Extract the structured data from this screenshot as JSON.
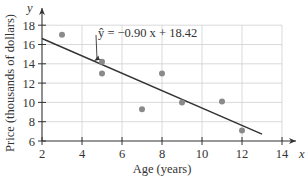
{
  "chart_data": {
    "type": "scatter",
    "title": "",
    "xlabel": "Age (years)",
    "ylabel": "Price (thousands of dollars)",
    "x_axis_symbol": "x",
    "y_axis_symbol": "y",
    "xlim": [
      2,
      14
    ],
    "ylim": [
      6,
      18
    ],
    "xticks": [
      2,
      4,
      6,
      8,
      10,
      12,
      14
    ],
    "yticks": [
      6,
      8,
      10,
      12,
      14,
      16,
      18
    ],
    "grid": true,
    "legend": null,
    "series": [
      {
        "name": "data points",
        "kind": "scatter",
        "color": "#8a8a8a",
        "points": [
          {
            "x": 3,
            "y": 17.0
          },
          {
            "x": 5,
            "y": 14.2
          },
          {
            "x": 5,
            "y": 13.0
          },
          {
            "x": 7,
            "y": 9.3
          },
          {
            "x": 8,
            "y": 13.0
          },
          {
            "x": 9,
            "y": 10.0
          },
          {
            "x": 11,
            "y": 10.1
          },
          {
            "x": 12,
            "y": 7.1
          }
        ]
      },
      {
        "name": "regression line",
        "kind": "line",
        "color": "#333333",
        "slope": -0.9,
        "intercept": 18.42,
        "x_range": [
          2,
          13
        ]
      }
    ],
    "annotations": [
      {
        "text": "ŷ = −0.90 x + 18.42",
        "points_to": {
          "x": 4.6,
          "y": 14.28
        }
      }
    ]
  }
}
